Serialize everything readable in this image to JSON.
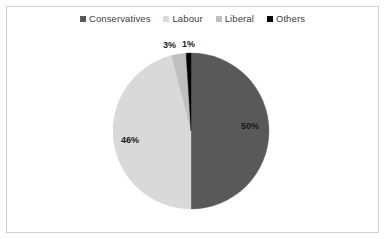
{
  "canvas": {
    "width": 385,
    "height": 239,
    "background": "#ffffff",
    "border_color": "#d0d0d0"
  },
  "legend": {
    "position": "top-center",
    "items": [
      {
        "label": "Conservatives",
        "color": "#595959",
        "marker": "square-marker"
      },
      {
        "label": "Labour",
        "color": "#d9d9d9",
        "marker": "square-marker"
      },
      {
        "label": "Liberal",
        "color": "#bfbfbf",
        "marker": "square-marker"
      },
      {
        "label": "Others",
        "color": "#000000",
        "marker": "square-marker"
      }
    ]
  },
  "labels": {
    "conservatives": "50%",
    "labour": "46%",
    "liberal": "3%",
    "others": "1%"
  },
  "chart_data": {
    "type": "pie",
    "title": "",
    "subtitle": "",
    "xlabel": "",
    "ylabel": "",
    "grid": false,
    "legend_position": "top-center",
    "start_angle_deg": 0,
    "direction": "clockwise",
    "center": {
      "x": 191,
      "y": 131
    },
    "radius": 78,
    "categories": [
      "Conservatives",
      "Labour",
      "Liberal",
      "Others"
    ],
    "values": [
      50,
      46,
      3,
      1
    ],
    "unit": "%",
    "data_labels": [
      "50%",
      "46%",
      "3%",
      "1%"
    ],
    "colors": [
      "#595959",
      "#d9d9d9",
      "#bfbfbf",
      "#000000"
    ],
    "slices": [
      {
        "name": "Conservatives",
        "value": 50,
        "label": "50%",
        "color": "#595959",
        "start_deg": 0,
        "end_deg": 180
      },
      {
        "name": "Labour",
        "value": 46,
        "label": "46%",
        "color": "#d9d9d9",
        "start_deg": 180,
        "end_deg": 345.6
      },
      {
        "name": "Liberal",
        "value": 3,
        "label": "3%",
        "color": "#bfbfbf",
        "start_deg": 345.6,
        "end_deg": 356.4
      },
      {
        "name": "Others",
        "value": 1,
        "label": "1%",
        "color": "#000000",
        "start_deg": 356.4,
        "end_deg": 360
      }
    ]
  }
}
